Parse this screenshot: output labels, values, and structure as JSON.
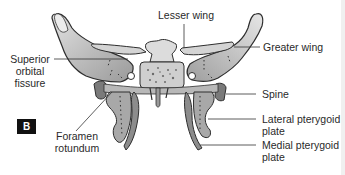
{
  "figure": {
    "badge": "B"
  },
  "labels": {
    "lesser_wing": "Lesser wing",
    "greater_wing": "Greater wing",
    "superior_orbital_fissure_line1": "Superior",
    "superior_orbital_fissure_line2": "orbital",
    "superior_orbital_fissure_line3": "fissure",
    "spine": "Spine",
    "foramen_rotundum_line1": "Foramen",
    "foramen_rotundum_line2": "rotundum",
    "lateral_pterygoid_line1": "Lateral pterygoid",
    "lateral_pterygoid_line2": "plate",
    "medial_pterygoid_line1": "Medial pterygoid",
    "medial_pterygoid_line2": "plate"
  },
  "colors": {
    "bone_fill": "#c4c4c4",
    "bone_dark": "#6a6a6a",
    "outline": "#2e2e2e",
    "leader_line": "#333333"
  }
}
